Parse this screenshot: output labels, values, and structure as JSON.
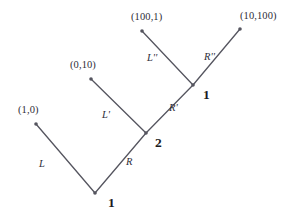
{
  "diagram": {
    "stroke_color": "#55555f",
    "text_color": "#2e2e38",
    "background": "#ffffff",
    "nodes": [
      {
        "id": "root",
        "label": "1",
        "x": 95,
        "y": 193,
        "label_x": 108,
        "label_y": 196
      },
      {
        "id": "mid",
        "label": "2",
        "x": 146,
        "y": 133,
        "label_x": 155,
        "label_y": 136
      },
      {
        "id": "upper",
        "label": "1",
        "x": 193,
        "y": 85,
        "label_x": 203,
        "label_y": 88
      }
    ],
    "leaves": [
      {
        "id": "leaf-1-0",
        "label": "(1,0)",
        "x": 36,
        "y": 124,
        "label_x": 18,
        "label_y": 105
      },
      {
        "id": "leaf-0-10",
        "label": "(0,10)",
        "x": 91,
        "y": 79,
        "label_x": 70,
        "label_y": 60
      },
      {
        "id": "leaf-100-1",
        "label": "(100,1)",
        "x": 142,
        "y": 31,
        "label_x": 131,
        "label_y": 12
      },
      {
        "id": "leaf-10-100",
        "label": "(10,100)",
        "x": 240,
        "y": 29,
        "label_x": 240,
        "label_y": 11
      }
    ],
    "edges": [
      {
        "id": "edge-L",
        "label": "L",
        "from": "root",
        "to": "leaf-1-0",
        "x1": 36,
        "y1": 124,
        "x2": 95,
        "y2": 193,
        "label_x": 39,
        "label_y": 159
      },
      {
        "id": "edge-R",
        "label": "R",
        "from": "root",
        "to": "mid",
        "x1": 95,
        "y1": 193,
        "x2": 146,
        "y2": 133,
        "label_x": 126,
        "label_y": 157
      },
      {
        "id": "edge-Lp",
        "label": "L'",
        "from": "mid",
        "to": "leaf-0-10",
        "x1": 91,
        "y1": 79,
        "x2": 146,
        "y2": 133,
        "label_x": 102,
        "label_y": 110
      },
      {
        "id": "edge-Rp",
        "label": "R'",
        "from": "mid",
        "to": "upper",
        "x1": 146,
        "y1": 133,
        "x2": 193,
        "y2": 85,
        "label_x": 169,
        "label_y": 103
      },
      {
        "id": "edge-Lpp",
        "label": "L''",
        "from": "upper",
        "to": "leaf-100-1",
        "x1": 142,
        "y1": 31,
        "x2": 193,
        "y2": 85,
        "label_x": 147,
        "label_y": 53
      },
      {
        "id": "edge-Rpp",
        "label": "R''",
        "from": "upper",
        "to": "leaf-10-100",
        "x1": 193,
        "y1": 85,
        "x2": 240,
        "y2": 29,
        "label_x": 204,
        "label_y": 52
      }
    ]
  }
}
